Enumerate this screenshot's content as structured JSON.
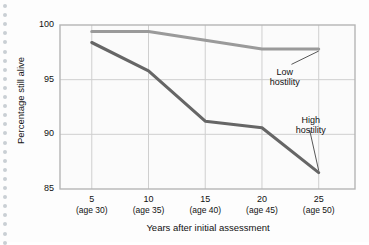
{
  "chart_data": {
    "type": "line",
    "title": "",
    "xlabel": "Years after initial assessment",
    "ylabel": "Percentage still alive",
    "x": [
      5,
      10,
      15,
      20,
      25
    ],
    "xtick_labels": [
      "5",
      "10",
      "15",
      "20",
      "25"
    ],
    "xtick_sublabels": [
      "(age 30)",
      "(age 35)",
      "(age 40)",
      "(age 45)",
      "(age 50)"
    ],
    "ytick_labels": [
      "85",
      "90",
      "95",
      "100"
    ],
    "yticks": [
      85,
      90,
      95,
      100
    ],
    "ylim": [
      85,
      100
    ],
    "xlim": [
      2.2,
      28.2
    ],
    "grid": true,
    "legend_position": "inline-annotation",
    "series": [
      {
        "name": "Low hostility",
        "color": "#9a9a9a",
        "values": [
          99.4,
          99.4,
          98.6,
          97.8,
          97.8
        ]
      },
      {
        "name": "High hostility",
        "color": "#666666",
        "values": [
          98.4,
          95.8,
          91.2,
          90.6,
          86.5
        ]
      }
    ],
    "annotations": [
      {
        "text_line1": "Low",
        "text_line2": "hostility",
        "target_series": "Low hostility"
      },
      {
        "text_line1": "High",
        "text_line2": "hostility",
        "target_series": "High hostility"
      }
    ],
    "colors": {
      "plot_background": "#fbfbfb",
      "grid": "#cfcfcf",
      "frame": "#b5b5b5",
      "text": "#111111",
      "dot_rail": "#c9cfd4"
    }
  }
}
